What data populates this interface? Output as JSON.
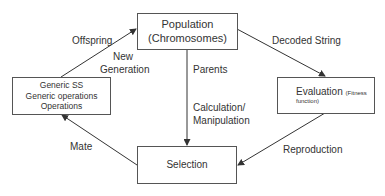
{
  "nodes": {
    "population": {
      "line1": "Population",
      "line2": "(Chromosomes)"
    },
    "generic": {
      "line1": "Generic SS",
      "line2": "Generic operations",
      "line3": "Operations"
    },
    "evaluation": {
      "main": "Evaluation",
      "small1": "(Fitness",
      "small2": "function)"
    },
    "selection": {
      "label": "Selection"
    }
  },
  "edges": {
    "offspring": "Offspring",
    "new_generation_1": "New",
    "new_generation_2": "Generation",
    "decoded_string": "Decoded String",
    "parents": "Parents",
    "calc_1": "Calculation/",
    "calc_2": "Manipulation",
    "reproduction": "Reproduction",
    "mate": "Mate"
  }
}
